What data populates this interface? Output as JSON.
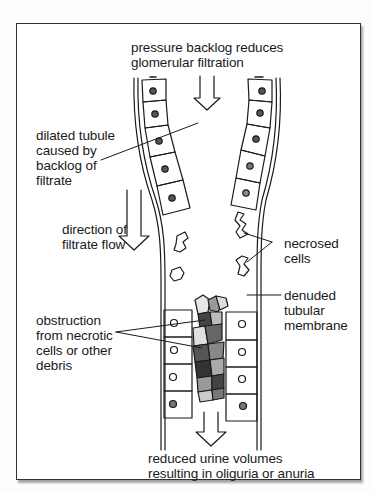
{
  "diagram": {
    "type": "annotated illustration",
    "colors": {
      "ink": "#1a1a1a",
      "frame": "#333333",
      "background": "#ffffff",
      "debris_dark": "#555555",
      "debris_light": "#bbbbbb"
    },
    "labels": {
      "top": {
        "line1": "pressure backlog reduces",
        "line2": "glomerular filtration"
      },
      "dilated_tubule": {
        "line1": "dilated tubule",
        "line2": "caused by",
        "line3": "backlog of",
        "line4": "filtrate"
      },
      "flow_direction": {
        "line1": "direction of",
        "line2": "filtrate flow"
      },
      "necrosed_cells": {
        "line1": "necrosed",
        "line2": "cells"
      },
      "denuded_membrane": {
        "line1": "denuded",
        "line2": "tubular",
        "line3": "membrane"
      },
      "obstruction": {
        "line1": "obstruction",
        "line2": "from necrotic",
        "line3": "cells or other",
        "line4": "debris"
      },
      "bottom": {
        "line1": "reduced urine volumes",
        "line2": "resulting in oliguria or anuria"
      }
    },
    "arrows": [
      {
        "name": "filtration-arrow",
        "direction": "down",
        "position": "top-center"
      },
      {
        "name": "filtrate-flow-arrow",
        "direction": "down",
        "position": "left-outside"
      },
      {
        "name": "urine-output-arrow",
        "direction": "down",
        "position": "bottom-center"
      }
    ]
  }
}
